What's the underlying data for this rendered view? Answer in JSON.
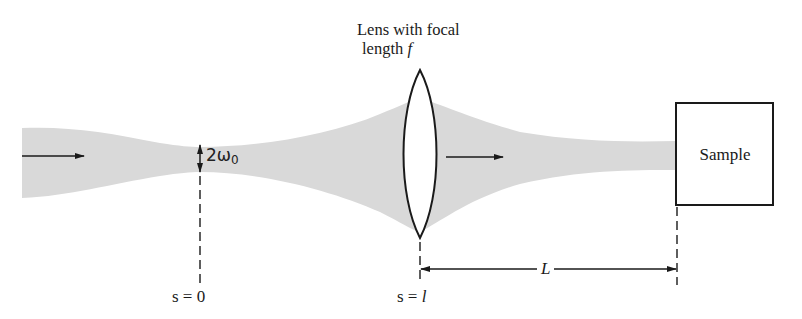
{
  "diagram": {
    "type": "optics-beam-focusing",
    "beam": {
      "direction": "left-to-right",
      "color": "#d9d9d9",
      "start_x": 22,
      "waist_x": 200,
      "lens_x": 420,
      "end_x": 676
    },
    "labels": {
      "lens_line1": "Lens with focal",
      "lens_line2_prefix": "length ",
      "lens_symbol": "f",
      "waist_prefix": "2ω",
      "waist_subscript": "0",
      "sample": "Sample",
      "s0": "s = 0",
      "sl_prefix": "s = ",
      "sl_symbol": "l",
      "distance": "L"
    },
    "colors": {
      "ink": "#1a1a1a",
      "beam": "#d9d9d9",
      "background": "#ffffff"
    }
  }
}
